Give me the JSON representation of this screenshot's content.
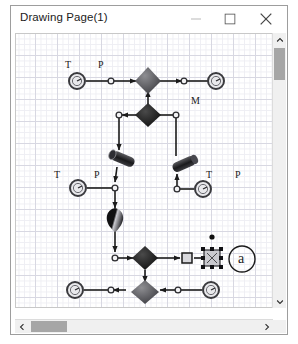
{
  "window": {
    "title": "Drawing Page(1)",
    "controls": [
      {
        "name": "minimize-button",
        "icon": "minimize-icon"
      },
      {
        "name": "maximize-button",
        "icon": "maximize-icon"
      },
      {
        "name": "close-button",
        "icon": "close-icon"
      }
    ]
  },
  "canvas": {
    "grid": {
      "minor_px": 5.5,
      "major_px": 22,
      "minor_color": "#eeeef3",
      "major_color": "#d8d8e2"
    },
    "labels": [
      {
        "text": "T",
        "x": 49,
        "y": 26
      },
      {
        "text": "P",
        "x": 82,
        "y": 26
      },
      {
        "text": "M",
        "x": 175,
        "y": 62
      },
      {
        "text": "T",
        "x": 38,
        "y": 136
      },
      {
        "text": "P",
        "x": 78,
        "y": 136
      },
      {
        "text": "T",
        "x": 190,
        "y": 136
      },
      {
        "text": "P",
        "x": 219,
        "y": 136
      },
      {
        "text": "a",
        "x": 222,
        "y": 221
      }
    ],
    "shapes": {
      "circle_nodes": [
        {
          "name": "node-circle-1",
          "cx": 61,
          "cy": 47
        },
        {
          "name": "node-circle-2",
          "cx": 200,
          "cy": 47
        },
        {
          "name": "node-circle-3",
          "cx": 62,
          "cy": 154
        },
        {
          "name": "node-circle-4",
          "cx": 187,
          "cy": 155
        },
        {
          "name": "node-circle-5",
          "cx": 59,
          "cy": 256
        },
        {
          "name": "node-circle-6",
          "cx": 195,
          "cy": 256
        }
      ],
      "diamonds": [
        {
          "name": "diamond-light-1",
          "cx": 132,
          "cy": 45,
          "tone": "light"
        },
        {
          "name": "diamond-dark-1",
          "cx": 132,
          "cy": 81,
          "tone": "dark"
        },
        {
          "name": "diamond-dark-2",
          "cx": 129,
          "cy": 224,
          "tone": "dark"
        },
        {
          "name": "diamond-light-2",
          "cx": 129,
          "cy": 258,
          "tone": "light"
        }
      ],
      "cylinders": [
        {
          "name": "cylinder-1",
          "cx": 107,
          "cy": 125
        },
        {
          "name": "cylinder-2",
          "cx": 168,
          "cy": 130
        }
      ],
      "cone": {
        "name": "cone-funnel",
        "cx": 99,
        "cy": 185
      },
      "junctions": [
        {
          "name": "junction-1",
          "cx": 95,
          "cy": 47
        },
        {
          "name": "junction-2",
          "cx": 103,
          "cy": 81
        },
        {
          "name": "junction-3",
          "cx": 168,
          "cy": 47
        },
        {
          "name": "junction-4",
          "cx": 160,
          "cy": 81
        },
        {
          "name": "junction-5",
          "cx": 99,
          "cy": 154
        },
        {
          "name": "junction-6",
          "cx": 99,
          "cy": 224
        },
        {
          "name": "junction-7",
          "cx": 161,
          "cy": 155
        },
        {
          "name": "junction-8",
          "cx": 95,
          "cy": 256
        },
        {
          "name": "junction-9",
          "cx": 162,
          "cy": 256
        }
      ],
      "selected_node": {
        "name": "selected-element",
        "cx": 196,
        "cy": 224
      },
      "gateway_square": {
        "name": "gateway-square",
        "cx": 171,
        "cy": 224
      },
      "dot_marker": {
        "name": "dot-marker",
        "cx": 196,
        "cy": 203
      },
      "annotation_circle": {
        "name": "annotation-circle-a",
        "cx": 226,
        "cy": 225,
        "r": 13
      }
    }
  },
  "scrollbars": {
    "vertical": {
      "up": "chevron-up-icon",
      "down": "chevron-down-icon",
      "thumb_pos": 15
    },
    "horizontal": {
      "left": "chevron-left-icon",
      "right": "chevron-right-icon",
      "thumb_pos": 16
    }
  }
}
